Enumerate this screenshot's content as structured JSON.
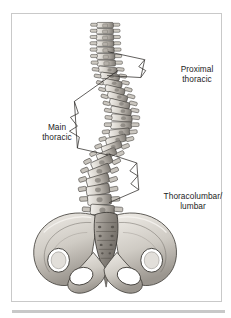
{
  "figure": {
    "type": "medical-illustration",
    "background_color": "#ffffff",
    "frame_color": "#c9c9c9",
    "rule_color": "#c8c8c8",
    "ink_color": "#1c1c1c",
    "bone_light": "#e9e6e0",
    "bone_mid": "#bdb9b2",
    "bone_dark": "#8a8680"
  },
  "annotations": [
    {
      "id": "proximal-thoracic",
      "line1": "Proximal",
      "line2": "thoracic",
      "region": "upper thoracic spine",
      "bracket": "cobb-angle-right"
    },
    {
      "id": "main-thoracic",
      "line1": "Main",
      "line2": "thoracic",
      "region": "mid thoracic spine",
      "bracket": "cobb-angle-left"
    },
    {
      "id": "thoracolumbar-lumbar",
      "line1": "Thoracolumbar/",
      "line2": "lumbar",
      "region": "thoracolumbar junction and lumbar spine",
      "bracket": "cobb-angle-right"
    }
  ]
}
